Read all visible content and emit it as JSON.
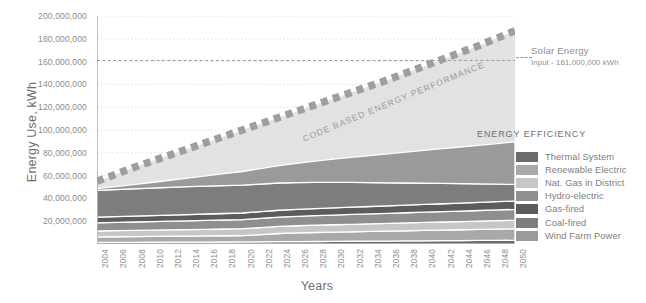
{
  "chart_data": {
    "type": "area",
    "title": "",
    "xlabel": "Years",
    "ylabel": "Energy Use, kWh",
    "xlim": [
      2004,
      2050
    ],
    "ylim": [
      0,
      200000000
    ],
    "ytick_step": 20000000,
    "ytick_labels": [
      "200,000,000",
      "180,000,000",
      "160,000,000",
      "140,000,000",
      "120,000,000",
      "100,000,000",
      "80,000,000",
      "60,000,000",
      "40,000,000",
      "20,000,000"
    ],
    "ytick_values": [
      200000000,
      180000000,
      160000000,
      140000000,
      120000000,
      100000000,
      80000000,
      60000000,
      40000000,
      20000000
    ],
    "xtick_labels": [
      "2004",
      "2006",
      "2008",
      "2010",
      "2012",
      "2014",
      "2016",
      "2018",
      "2020",
      "2022",
      "2024",
      "2026",
      "2028",
      "2030",
      "2032",
      "2034",
      "2036",
      "2038",
      "2040",
      "2042",
      "2044",
      "2046",
      "2048",
      "2050"
    ],
    "grid": true,
    "stacked": true,
    "legend_position": "right",
    "x": [
      2004,
      2006,
      2008,
      2010,
      2012,
      2014,
      2016,
      2018,
      2020,
      2022,
      2024,
      2026,
      2028,
      2030,
      2032,
      2034,
      2036,
      2038,
      2040,
      2042,
      2044,
      2046,
      2048,
      2050
    ],
    "series": [
      {
        "name": "Wind Farm Power",
        "color": "#9a9a9a",
        "values": [
          1500000,
          2600000,
          3700000,
          4900000,
          6200000,
          7600000,
          9000000,
          10500000,
          12000000,
          13600000,
          15200000,
          16900000,
          18600000,
          20300000,
          22000000,
          23700000,
          25400000,
          27100000,
          28800000,
          30500000,
          32200000,
          33900000,
          35600000,
          37300000
        ]
      },
      {
        "name": "Coal-fired",
        "color": "#7d7d7d",
        "values": [
          23500000,
          23700000,
          23900000,
          24100000,
          24300000,
          24400000,
          24500000,
          24500000,
          24400000,
          24200000,
          23900000,
          23500000,
          23000000,
          22400000,
          21700000,
          21000000,
          20200000,
          19400000,
          18600000,
          17800000,
          17000000,
          16200000,
          15400000,
          14600000
        ]
      },
      {
        "name": "Gas-fired",
        "color": "#5c5c5c",
        "values": [
          5000000,
          5100000,
          5200000,
          5300000,
          5400000,
          5500000,
          5600000,
          5700000,
          5800000,
          5900000,
          6000000,
          6100000,
          6200000,
          6300000,
          6400000,
          6500000,
          6600000,
          6700000,
          6800000,
          6900000,
          7000000,
          7100000,
          7200000,
          7300000
        ]
      },
      {
        "name": "Hydro-electric",
        "color": "#8f8f8f",
        "values": [
          7200000,
          7300000,
          7400000,
          7500000,
          7600000,
          7700000,
          7800000,
          7900000,
          8000000,
          8100000,
          8200000,
          8300000,
          8400000,
          8500000,
          8600000,
          8700000,
          8800000,
          8900000,
          9000000,
          9100000,
          9200000,
          9300000,
          9400000,
          9500000
        ]
      },
      {
        "name": "Nat. Gas in District",
        "color": "#c6c6c6",
        "values": [
          5200000,
          5300000,
          5400000,
          5500000,
          5600000,
          5700000,
          5800000,
          5900000,
          6000000,
          6100000,
          6200000,
          6300000,
          6400000,
          6500000,
          6600000,
          6700000,
          6800000,
          6900000,
          7000000,
          7100000,
          7200000,
          7300000,
          7400000,
          7500000
        ]
      },
      {
        "name": "Renewable Electric",
        "color": "#a9a9a9",
        "values": [
          4800000,
          4900000,
          5000000,
          5100000,
          5200000,
          5300000,
          5400000,
          5500000,
          5600000,
          6400000,
          7200000,
          7600000,
          7900000,
          8100000,
          8300000,
          8500000,
          8700000,
          8900000,
          9100000,
          9300000,
          9500000,
          9700000,
          9900000,
          10100000
        ]
      },
      {
        "name": "Thermal System",
        "color": "#6b6b6b",
        "values": [
          1400000,
          1450000,
          1500000,
          1550000,
          1600000,
          1650000,
          1700000,
          1750000,
          1800000,
          1900000,
          2000000,
          2100000,
          2200000,
          2300000,
          2400000,
          2500000,
          2600000,
          2700000,
          2800000,
          2900000,
          3000000,
          3100000,
          3200000,
          3300000
        ]
      }
    ],
    "efficiency_band": {
      "name": "ENERGY EFFICIENCY",
      "color": "#e2e2e2",
      "label": "ENERGY EFFICIENCY"
    },
    "trend_line": {
      "name": "CODE BASED ENERGY PERFORMANCE",
      "label": "CODE BASED ENERGY PERFORMANCE",
      "style": "thick-dashed",
      "color": "#9e9e9e",
      "values": [
        55000000,
        61000000,
        67000000,
        72500000,
        78000000,
        83500000,
        89000000,
        94500000,
        100000000,
        105500000,
        111000000,
        116500000,
        122000000,
        127500000,
        133000000,
        138500000,
        144000000,
        150000000,
        156000000,
        162000000,
        168000000,
        174000000,
        180500000,
        187000000
      ]
    },
    "reference_line": {
      "label": "Solar Energy",
      "sublabel": "Input - 161,000,000 kWh",
      "value": 161000000,
      "style": "dashed",
      "color": "#9b9b9b"
    }
  },
  "legend": {
    "items": [
      {
        "label": "Thermal System",
        "color": "#6b6b6b"
      },
      {
        "label": "Renewable Electric",
        "color": "#a9a9a9"
      },
      {
        "label": "Nat. Gas in District",
        "color": "#c6c6c6"
      },
      {
        "label": "Hydro-electric",
        "color": "#8f8f8f"
      },
      {
        "label": "Gas-fired",
        "color": "#5c5c5c"
      },
      {
        "label": "Coal-fired",
        "color": "#7d7d7d"
      },
      {
        "label": "Wind Farm Power",
        "color": "#9a9a9a"
      }
    ]
  }
}
